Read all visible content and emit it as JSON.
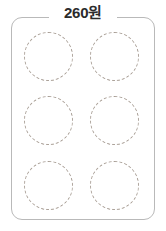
{
  "card": {
    "label": "260원",
    "border_color": "#b9b9b9",
    "background_color": "#ffffff",
    "label_color": "#2b2b2b"
  },
  "circles": {
    "dash_color": "#a99f96",
    "columns": 2,
    "rows": 3,
    "count": 6,
    "items": [
      {
        "id": "circle-1",
        "row": 1,
        "column": 1
      },
      {
        "id": "circle-2",
        "row": 1,
        "column": 2
      },
      {
        "id": "circle-3",
        "row": 2,
        "column": 1
      },
      {
        "id": "circle-4",
        "row": 2,
        "column": 2
      },
      {
        "id": "circle-5",
        "row": 3,
        "column": 1
      },
      {
        "id": "circle-6",
        "row": 3,
        "column": 2
      }
    ]
  }
}
